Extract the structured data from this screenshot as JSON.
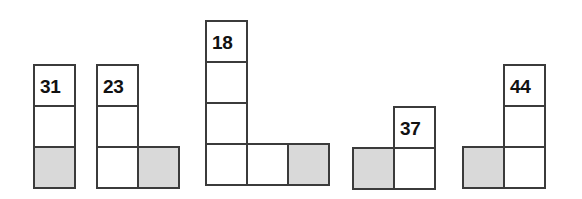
{
  "figure": {
    "title": "",
    "background_color": "#ffffff",
    "cell_fill_white": "#ffffff",
    "cell_fill_gray": "#d9d9d9",
    "cell_border_color": "#3b3b3b",
    "label_color": "#111111",
    "cell_size": 43,
    "shapes": [
      {
        "id": "shape-1",
        "label": "31",
        "x": 33,
        "y": 64,
        "cells": [
          {
            "col": 0,
            "row": 0,
            "fill": "white",
            "label": "31"
          },
          {
            "col": 0,
            "row": 1,
            "fill": "white",
            "label": ""
          },
          {
            "col": 0,
            "row": 2,
            "fill": "gray",
            "label": ""
          }
        ]
      },
      {
        "id": "shape-2",
        "label": "23",
        "x": 96,
        "y": 64,
        "cells": [
          {
            "col": 0,
            "row": 0,
            "fill": "white",
            "label": "23"
          },
          {
            "col": 0,
            "row": 1,
            "fill": "white",
            "label": ""
          },
          {
            "col": 0,
            "row": 2,
            "fill": "white",
            "label": ""
          },
          {
            "col": 1,
            "row": 2,
            "fill": "gray",
            "label": ""
          }
        ]
      },
      {
        "id": "shape-3",
        "label": "18",
        "x": 205,
        "y": 20,
        "cells": [
          {
            "col": 0,
            "row": 0,
            "fill": "white",
            "label": "18"
          },
          {
            "col": 0,
            "row": 1,
            "fill": "white",
            "label": ""
          },
          {
            "col": 0,
            "row": 2,
            "fill": "white",
            "label": ""
          },
          {
            "col": 0,
            "row": 3,
            "fill": "white",
            "label": ""
          },
          {
            "col": 1,
            "row": 3,
            "fill": "white",
            "label": ""
          },
          {
            "col": 2,
            "row": 3,
            "fill": "gray",
            "label": ""
          }
        ]
      },
      {
        "id": "shape-4",
        "label": "37",
        "x": 352,
        "y": 106,
        "cells": [
          {
            "col": 1,
            "row": 0,
            "fill": "white",
            "label": "37"
          },
          {
            "col": 0,
            "row": 1,
            "fill": "gray",
            "label": ""
          },
          {
            "col": 1,
            "row": 1,
            "fill": "white",
            "label": ""
          }
        ]
      },
      {
        "id": "shape-5",
        "label": "44",
        "x": 462,
        "y": 64,
        "cells": [
          {
            "col": 1,
            "row": 0,
            "fill": "white",
            "label": "44"
          },
          {
            "col": 1,
            "row": 1,
            "fill": "white",
            "label": ""
          },
          {
            "col": 0,
            "row": 2,
            "fill": "gray",
            "label": ""
          },
          {
            "col": 1,
            "row": 2,
            "fill": "white",
            "label": ""
          }
        ]
      }
    ]
  }
}
